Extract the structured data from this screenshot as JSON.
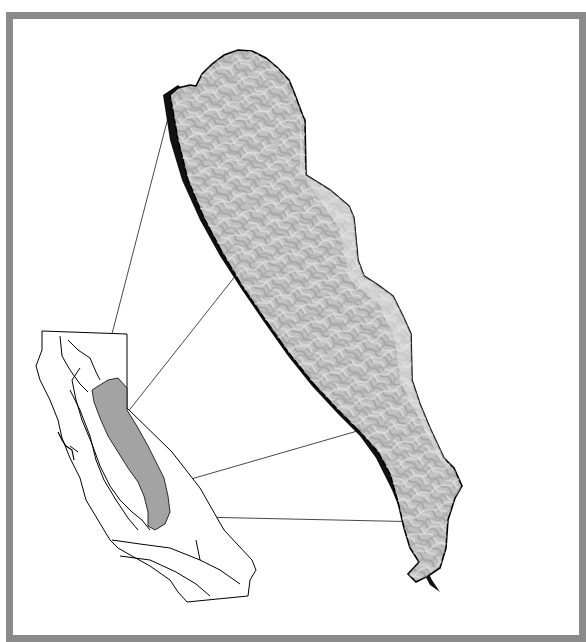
{
  "figure": {
    "type": "locator-map",
    "frame_color": "#8a8a8a",
    "background_color": "#ffffff"
  },
  "locator_map": {
    "region": "California",
    "highlight_fill": "#a3a3a3",
    "outline_color": "#000000"
  },
  "inset_map": {
    "style": "shaded-relief",
    "relief_fill": "#b9b9b9",
    "shadow_color": "#111111",
    "outline_color": "#000000"
  },
  "connector_lines": {
    "count": 4,
    "color": "#333333"
  }
}
